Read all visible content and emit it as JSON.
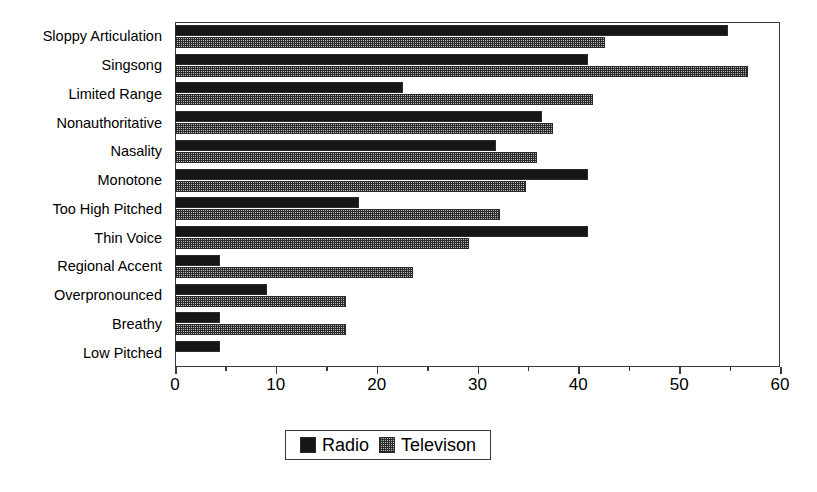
{
  "chart_data": {
    "type": "bar",
    "orientation": "horizontal",
    "title": "",
    "subtitle": "",
    "xlabel": "",
    "ylabel": "",
    "xlim": [
      0,
      60
    ],
    "xticks": [
      0,
      10,
      20,
      30,
      40,
      50,
      60
    ],
    "xtick_labels": [
      "0",
      "10",
      "20",
      "30",
      "40",
      "50",
      "60"
    ],
    "minor_xticks": [
      5,
      15,
      25,
      35,
      45,
      55
    ],
    "grid": false,
    "legend_position": "bottom-center",
    "categories": [
      "Sloppy Articulation",
      "Singsong",
      "Limited Range",
      "Nonauthoritative",
      "Nasality",
      "Monotone",
      "Too High Pitched",
      "Thin Voice",
      "Regional Accent",
      "Overpronounced",
      "Breathy",
      "Low Pitched"
    ],
    "series": [
      {
        "name": "Radio",
        "color": "#161616",
        "pattern": "solid",
        "values": [
          54.8,
          41.0,
          22.6,
          36.4,
          31.8,
          41.0,
          18.2,
          41.0,
          4.5,
          9.1,
          4.5,
          4.5
        ]
      },
      {
        "name": "Televison",
        "color": "#b9b9b9",
        "pattern": "dotted",
        "values": [
          42.6,
          56.8,
          41.5,
          37.5,
          35.9,
          34.8,
          32.2,
          29.2,
          23.6,
          17.0,
          17.0,
          0
        ]
      }
    ]
  },
  "legend": {
    "entries": [
      {
        "label": "Radio"
      },
      {
        "label": "Televison"
      }
    ]
  }
}
